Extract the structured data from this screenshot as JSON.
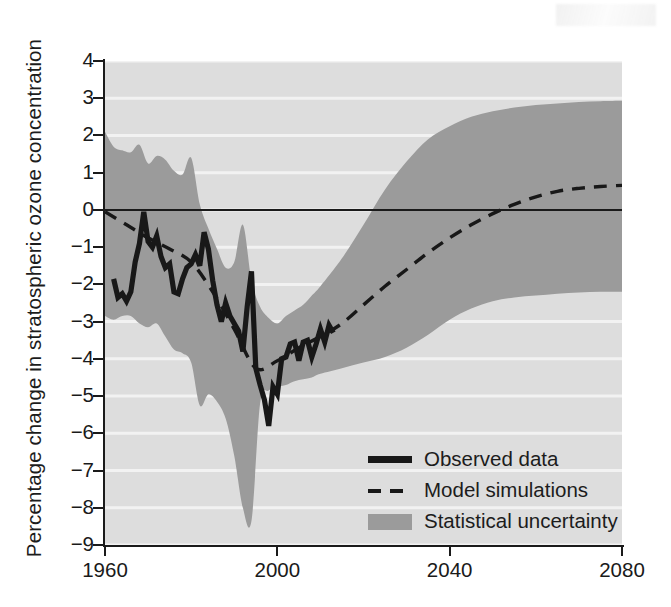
{
  "chart_data": {
    "type": "line",
    "title": "",
    "xlabel": "",
    "ylabel": "Percentage change in stratospheric ozone concentration",
    "xlim": [
      1960,
      2080
    ],
    "ylim": [
      -9,
      4
    ],
    "xticks": [
      1960,
      2000,
      2040,
      2080
    ],
    "yticks": [
      4,
      3,
      2,
      1,
      0,
      -1,
      -2,
      -3,
      -4,
      -5,
      -6,
      -7,
      -8,
      -9
    ],
    "ytick_labels": [
      "4",
      "3",
      "2",
      "1",
      "0",
      "−1",
      "−2",
      "−3",
      "−4",
      "−5",
      "−6",
      "−7",
      "−8",
      "−9"
    ],
    "xtick_labels": [
      "1960",
      "2000",
      "2040",
      "2080"
    ],
    "grid": "horizontal-white",
    "zero_line": true,
    "legend_position": "lower-right",
    "colors": {
      "plot_background": "#dddddd",
      "uncertainty_band": "#9b9b9b",
      "observed_line": "#181818",
      "model_line": "#181818",
      "gridline": "#f2f2f2",
      "axis": "#1a1a1a"
    },
    "series": [
      {
        "name": "Observed data",
        "style": "solid-thick",
        "x": [
          1962,
          1963,
          1964,
          1965,
          1966,
          1967,
          1968,
          1969,
          1970,
          1971,
          1972,
          1973,
          1974,
          1975,
          1976,
          1977,
          1978,
          1979,
          1980,
          1981,
          1982,
          1983,
          1984,
          1985,
          1986,
          1987,
          1988,
          1989,
          1990,
          1991,
          1992,
          1993,
          1994,
          1995,
          1996,
          1997,
          1998,
          1999,
          2000,
          2001,
          2002,
          2003,
          2004,
          2005,
          2006,
          2007,
          2008,
          2009,
          2010,
          2011,
          2012,
          2013
        ],
        "values": [
          -1.85,
          -2.35,
          -2.25,
          -2.45,
          -2.2,
          -1.4,
          -0.9,
          -0.05,
          -0.85,
          -1.0,
          -0.7,
          -1.25,
          -1.55,
          -1.45,
          -2.2,
          -2.25,
          -1.85,
          -1.55,
          -1.45,
          -1.2,
          -1.5,
          -0.6,
          -1.05,
          -1.9,
          -2.55,
          -3.0,
          -2.5,
          -2.85,
          -3.05,
          -3.25,
          -3.8,
          -2.6,
          -1.65,
          -4.25,
          -4.7,
          -5.1,
          -5.8,
          -4.75,
          -4.95,
          -4.0,
          -3.95,
          -3.6,
          -3.55,
          -4.05,
          -3.55,
          -3.5,
          -3.95,
          -3.6,
          -3.2,
          -3.55,
          -3.1,
          -3.3
        ]
      },
      {
        "name": "Model simulations",
        "style": "dashed",
        "x": [
          1960,
          1965,
          1970,
          1975,
          1980,
          1985,
          1990,
          1995,
          2000,
          2005,
          2010,
          2015,
          2020,
          2025,
          2030,
          2035,
          2040,
          2045,
          2050,
          2055,
          2060,
          2065,
          2070,
          2075,
          2080
        ],
        "values": [
          -0.05,
          -0.4,
          -0.75,
          -1.05,
          -1.4,
          -2.2,
          -3.2,
          -4.25,
          -4.05,
          -3.7,
          -3.4,
          -3.05,
          -2.55,
          -2.05,
          -1.6,
          -1.15,
          -0.75,
          -0.4,
          -0.1,
          0.15,
          0.35,
          0.5,
          0.58,
          0.63,
          0.66
        ]
      }
    ],
    "uncertainty_band": {
      "name": "Statistical uncertainty",
      "x": [
        1960,
        1962,
        1964,
        1966,
        1968,
        1970,
        1972,
        1974,
        1976,
        1978,
        1980,
        1982,
        1984,
        1986,
        1988,
        1990,
        1992,
        1994,
        1996,
        1998,
        2000,
        2002,
        2004,
        2006,
        2008,
        2010,
        2015,
        2020,
        2025,
        2030,
        2035,
        2040,
        2045,
        2050,
        2055,
        2060,
        2065,
        2070,
        2075,
        2080
      ],
      "upper": [
        2.1,
        1.7,
        1.6,
        1.55,
        1.75,
        1.25,
        1.45,
        1.35,
        1.05,
        0.95,
        1.4,
        0.15,
        -0.5,
        -1.05,
        -1.55,
        -1.4,
        -0.4,
        -1.9,
        -2.6,
        -2.9,
        -3.05,
        -2.85,
        -2.7,
        -2.55,
        -2.3,
        -2.05,
        -1.3,
        -0.4,
        0.55,
        1.3,
        1.9,
        2.25,
        2.5,
        2.65,
        2.75,
        2.82,
        2.86,
        2.9,
        2.92,
        2.93
      ],
      "lower": [
        -2.85,
        -2.95,
        -2.85,
        -2.85,
        -3.05,
        -3.15,
        -3.05,
        -3.4,
        -3.75,
        -3.85,
        -4.1,
        -5.25,
        -4.95,
        -5.15,
        -5.6,
        -6.6,
        -8.0,
        -8.35,
        -5.2,
        -4.85,
        -4.75,
        -4.7,
        -4.6,
        -4.55,
        -4.5,
        -4.4,
        -4.25,
        -4.1,
        -3.95,
        -3.7,
        -3.35,
        -2.95,
        -2.65,
        -2.45,
        -2.35,
        -2.3,
        -2.25,
        -2.22,
        -2.2,
        -2.2
      ]
    },
    "legend_entries": [
      {
        "label": "Observed data",
        "key": "solid-line-swatch"
      },
      {
        "label": "Model simulations",
        "key": "dashed-line-swatch"
      },
      {
        "label": "Statistical uncertainty",
        "key": "band-swatch"
      }
    ]
  }
}
